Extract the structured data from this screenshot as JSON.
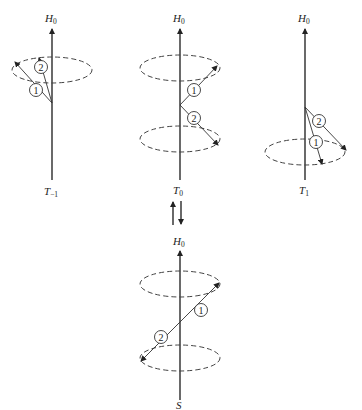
{
  "diagram": {
    "type": "spin-vector-precession",
    "colors": {
      "ink": "#2a2a2a",
      "background": "#ffffff"
    },
    "field_label": {
      "base": "H",
      "sub": "0"
    },
    "states": [
      {
        "id": "T-1",
        "label": {
          "base": "T",
          "sub": "−1"
        },
        "vectors": [
          "1",
          "2"
        ],
        "cones": [
          "upper"
        ]
      },
      {
        "id": "T0",
        "label": {
          "base": "T",
          "sub": "0"
        },
        "vectors": [
          "1",
          "2"
        ],
        "cones": [
          "upper",
          "lower"
        ]
      },
      {
        "id": "T1",
        "label": {
          "base": "T",
          "sub": "1"
        },
        "vectors": [
          "1",
          "2"
        ],
        "cones": [
          "lower"
        ]
      },
      {
        "id": "S",
        "label": {
          "base": "S",
          "sub": ""
        },
        "vectors": [
          "1",
          "2"
        ],
        "cones": [
          "upper",
          "lower"
        ]
      }
    ],
    "transition_symbol": "⇅"
  }
}
